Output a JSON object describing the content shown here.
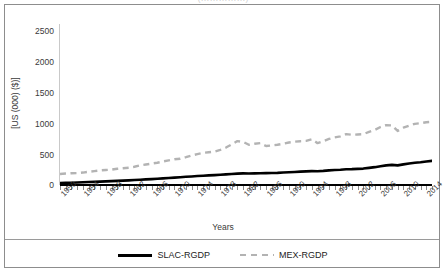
{
  "figure": {
    "title_remnant": "(……………)",
    "border_color": "#8d8d8d",
    "background": "#ffffff"
  },
  "axes": {
    "y_title": "[US (000) ($)]",
    "x_title": "Years",
    "y_ticks": [
      "0",
      "500",
      "1000",
      "1500",
      "2000",
      "2500"
    ],
    "x_ticks": [
      "1950",
      "1954",
      "1958",
      "1962",
      "1966",
      "1970",
      "1974",
      "1978",
      "1982",
      "1986",
      "1990",
      "1994",
      "1998",
      "2002",
      "2006",
      "2010",
      "2014"
    ]
  },
  "legend": {
    "position": "bottom",
    "entries": [
      {
        "label": "SLAC-RGDP",
        "style": "solid",
        "color": "#000000"
      },
      {
        "label": "MEX-RGDP",
        "style": "dashed",
        "color": "#b3b3b3"
      }
    ]
  },
  "chart_data": {
    "type": "line",
    "title": "",
    "xlabel": "Years",
    "ylabel": "[US (000) ($)]",
    "xlim": [
      1950,
      2015
    ],
    "ylim": [
      0,
      2500
    ],
    "ytick_values": [
      0,
      500,
      1000,
      1500,
      2000,
      2500
    ],
    "grid": false,
    "legend_position": "bottom",
    "x": [
      1950,
      1951,
      1952,
      1953,
      1954,
      1955,
      1956,
      1957,
      1958,
      1959,
      1960,
      1961,
      1962,
      1963,
      1964,
      1965,
      1966,
      1967,
      1968,
      1969,
      1970,
      1971,
      1972,
      1973,
      1974,
      1975,
      1976,
      1977,
      1978,
      1979,
      1980,
      1981,
      1982,
      1983,
      1984,
      1985,
      1986,
      1987,
      1988,
      1989,
      1990,
      1991,
      1992,
      1993,
      1994,
      1995,
      1996,
      1997,
      1998,
      1999,
      2000,
      2001,
      2002,
      2003,
      2004,
      2005,
      2006,
      2007,
      2008,
      2009,
      2010,
      2011,
      2012,
      2013,
      2014,
      2015
    ],
    "series": [
      {
        "name": "SLAC-RGDP",
        "style": "solid",
        "color": "#000000",
        "values": [
          30,
          33,
          36,
          39,
          42,
          46,
          49,
          53,
          56,
          60,
          64,
          68,
          72,
          77,
          82,
          87,
          92,
          97,
          103,
          109,
          115,
          121,
          127,
          133,
          139,
          144,
          149,
          154,
          159,
          165,
          171,
          177,
          180,
          178,
          180,
          183,
          184,
          186,
          189,
          194,
          198,
          202,
          207,
          211,
          216,
          213,
          219,
          227,
          233,
          236,
          244,
          246,
          250,
          255,
          266,
          277,
          291,
          305,
          312,
          305,
          320,
          335,
          345,
          353,
          365,
          375
        ]
      },
      {
        "name": "MEX-RGDP",
        "style": "dashed",
        "color": "#b3b3b3",
        "values": [
          170,
          178,
          183,
          185,
          193,
          205,
          215,
          226,
          233,
          238,
          252,
          260,
          268,
          283,
          305,
          318,
          332,
          345,
          365,
          382,
          400,
          408,
          432,
          458,
          480,
          500,
          508,
          518,
          545,
          582,
          630,
          682,
          670,
          625,
          640,
          650,
          605,
          615,
          625,
          640,
          660,
          672,
          680,
          685,
          710,
          650,
          680,
          715,
          740,
          755,
          790,
          780,
          785,
          790,
          825,
          855,
          900,
          930,
          925,
          840,
          890,
          920,
          950,
          960,
          975,
          980
        ]
      }
    ],
    "y_scale_note": "values in thousands of US dollars as plotted"
  }
}
